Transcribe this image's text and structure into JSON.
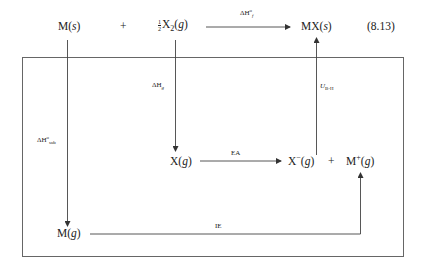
{
  "diagram": {
    "type": "Born-Haber cycle",
    "equation_number": "(8.13)",
    "top_row": {
      "reactant1": {
        "main": "M(",
        "state": "s",
        "close": ")"
      },
      "plus": "+",
      "reactant2": {
        "frac_num": "1",
        "frac_den": "2",
        "main": "X",
        "sub": "2",
        "open": "(",
        "state": "g",
        "close": ")"
      },
      "product": {
        "main": "MX(",
        "state": "s",
        "close": ")"
      },
      "arrow_label": {
        "delta": "ΔH",
        "sup": "o",
        "sub": "f"
      }
    },
    "nodes": {
      "x_gas": {
        "main": "X(",
        "state": "g",
        "close": ")"
      },
      "x_anion": {
        "main": "X",
        "sup": "−",
        "open": "(",
        "state": "g",
        "close": ")"
      },
      "plus2": "+",
      "m_cation": {
        "main": "M",
        "sup": "+",
        "open": "(",
        "state": "g",
        "close": ")"
      },
      "m_gas": {
        "main": "M(",
        "state": "g",
        "close": ")"
      }
    },
    "edge_labels": {
      "atomization_x": {
        "delta": "ΔH",
        "sub": "g"
      },
      "sublimation": {
        "delta": "ΔH",
        "sup": "o",
        "sub": "sub"
      },
      "electron_affinity": "EA",
      "ionization_energy": "IE",
      "lattice_energy": {
        "main": "U",
        "sub": "B-H"
      }
    },
    "colors": {
      "line": "#555555",
      "text": "#222222",
      "background": "#ffffff"
    }
  }
}
